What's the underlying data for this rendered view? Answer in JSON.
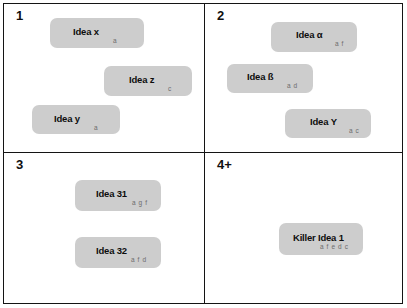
{
  "diagram": {
    "card_color": "#cdcdcd",
    "border_color": "#141414",
    "background_color": "#ffffff",
    "tag_color": "#6c6c6c"
  },
  "quadrants": [
    {
      "id": "q1",
      "label": "1",
      "cards": [
        {
          "title": "Idea x",
          "tags": "a"
        },
        {
          "title": "Idea z",
          "tags": "c"
        },
        {
          "title": "Idea y",
          "tags": "a"
        }
      ]
    },
    {
      "id": "q2",
      "label": "2",
      "cards": [
        {
          "title": "Idea α",
          "tags": "a f"
        },
        {
          "title": "Idea ß",
          "tags": "a d"
        },
        {
          "title": "Idea Υ",
          "tags": "a c"
        }
      ]
    },
    {
      "id": "q3",
      "label": "3",
      "cards": [
        {
          "title": "Idea 31",
          "tags": "a g f"
        },
        {
          "title": "Idea 32",
          "tags": "a f d"
        }
      ]
    },
    {
      "id": "q4",
      "label": "4+",
      "cards": [
        {
          "title": "Killer Idea 1",
          "tags": "a f e d c"
        }
      ]
    }
  ]
}
